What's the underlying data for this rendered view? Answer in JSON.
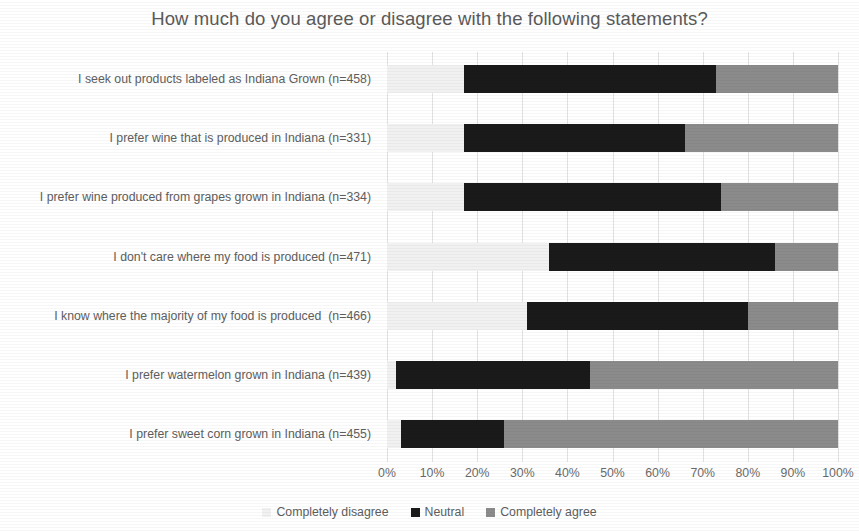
{
  "chart_data": {
    "type": "bar",
    "orientation": "horizontal",
    "stacked": true,
    "normalized_percent": true,
    "title": "How much do you agree or disagree with the following statements?",
    "xlabel": "",
    "ylabel": "",
    "xlim": [
      0,
      100
    ],
    "xticks": [
      "0%",
      "10%",
      "20%",
      "30%",
      "40%",
      "50%",
      "60%",
      "70%",
      "80%",
      "90%",
      "100%"
    ],
    "grid": true,
    "legend_position": "bottom",
    "categories": [
      "I seek out products labeled as Indiana Grown (n=458)",
      "I prefer wine that is produced in Indiana (n=331)",
      "I prefer wine produced from grapes grown in Indiana (n=334)",
      "I don't care where my food is produced (n=471)",
      "I know where the majority of my food is produced  (n=466)",
      "I prefer watermelon grown in Indiana (n=439)",
      "I prefer sweet corn grown in Indiana (n=455)"
    ],
    "series": [
      {
        "name": "Completely disagree",
        "color": "#f1f1f1",
        "values": [
          17,
          17,
          17,
          36,
          31,
          2,
          3
        ]
      },
      {
        "name": "Neutral",
        "color": "#1a1a1a",
        "values": [
          56,
          49,
          57,
          50,
          49,
          43,
          23
        ]
      },
      {
        "name": "Completely agree",
        "color": "#8b8b8b",
        "values": [
          27,
          34,
          26,
          14,
          20,
          55,
          74
        ]
      }
    ]
  },
  "legend": {
    "items": [
      {
        "label": "Completely disagree",
        "swatch": "disagree"
      },
      {
        "label": "Neutral",
        "swatch": "neutral"
      },
      {
        "label": "Completely agree",
        "swatch": "agree"
      }
    ]
  }
}
